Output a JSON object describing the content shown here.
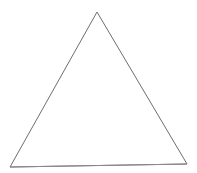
{
  "figure": {
    "type": "triangle-outline",
    "shape_name": "triangle",
    "classification": "isosceles triangle",
    "background_color": "#ffffff",
    "stroke_color": "#6e6e6e",
    "baseline_stroke_color": "#8a8a8a",
    "stroke_width": 1,
    "fill": "none",
    "canvas": {
      "width": 197,
      "height": 173
    },
    "vertices": [
      {
        "label": "apex",
        "x": 97,
        "y": 12
      },
      {
        "label": "bottom-right",
        "x": 187,
        "y": 164
      },
      {
        "label": "bottom-left",
        "x": 10,
        "y": 167
      }
    ],
    "points_attr": "97,12 187,164 10,167"
  },
  "clipped_caption": {
    "text": "",
    "note": "illegible"
  }
}
